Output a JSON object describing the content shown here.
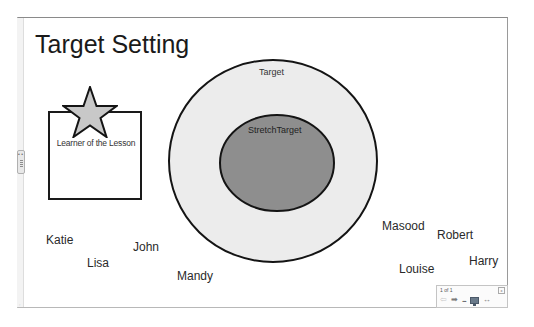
{
  "slide": {
    "title": "Target Setting",
    "learner_label": "Learner of the Lesson",
    "target_label": "Target",
    "stretch_label": "StretchTarget",
    "names": [
      {
        "label": "Katie",
        "x": 46,
        "y": 233
      },
      {
        "label": "Lisa",
        "x": 87,
        "y": 256
      },
      {
        "label": "John",
        "x": 133,
        "y": 240
      },
      {
        "label": "Mandy",
        "x": 177,
        "y": 269
      },
      {
        "label": "Masood",
        "x": 382,
        "y": 219
      },
      {
        "label": "Robert",
        "x": 437,
        "y": 228
      },
      {
        "label": "Louise",
        "x": 399,
        "y": 262
      },
      {
        "label": "Harry",
        "x": 469,
        "y": 254
      }
    ],
    "colors": {
      "outer_fill": "#ececec",
      "inner_fill": "#8e8e8e",
      "star_fill": "#c8c8c8",
      "stroke": "#141414"
    }
  },
  "navigator": {
    "page_count": "1 of 1",
    "close_glyph": "x",
    "prev_icon": "⇦",
    "next_icon": "➡",
    "more_label": "...",
    "collapse_glyph": "↔"
  },
  "rail": {
    "handle_dots": "• •"
  }
}
